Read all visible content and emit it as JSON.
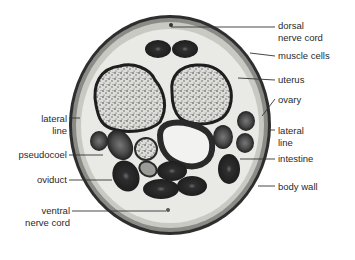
{
  "figure": {
    "colors": {
      "background": "#ffffff",
      "body_fill": "#e8e8e6",
      "body_wall": "#2e2e2e",
      "organ_dark": "#2b2b2b",
      "organ_mid": "#5a5a5a",
      "uterus_fill": "#d9d9d6",
      "label_text": "#2a2a2a"
    }
  },
  "labels": {
    "right": [
      {
        "line1": "dorsal",
        "line2": "nerve cord"
      },
      {
        "line1": "muscle cells"
      },
      {
        "line1": "uterus"
      },
      {
        "line1": "ovary"
      },
      {
        "line1": "lateral",
        "line2": "line"
      },
      {
        "line1": "intestine"
      },
      {
        "line1": "body wall"
      }
    ],
    "left": [
      {
        "line1": "lateral",
        "line2": "line"
      },
      {
        "line1": "pseudocoel"
      },
      {
        "line1": "oviduct"
      },
      {
        "line1": "ventral",
        "line2": "nerve cord"
      }
    ]
  }
}
